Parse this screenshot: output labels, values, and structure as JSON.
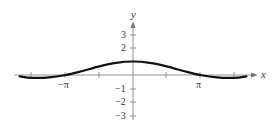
{
  "chart_data": {
    "type": "line",
    "title": "",
    "xlabel": "x",
    "ylabel": "y",
    "x_tick_labels": [
      "−π",
      "π"
    ],
    "x_ticks": [
      -4.712,
      -3.1416,
      -1.5708,
      0,
      1.5708,
      3.1416,
      4.712
    ],
    "y_tick_labels": [
      "3",
      "2",
      "−1",
      "−2",
      "−3"
    ],
    "y_ticks": [
      3,
      2,
      -1,
      -2,
      -3
    ],
    "xlim": [
      -5.5,
      5.5
    ],
    "ylim": [
      -3.5,
      4
    ],
    "grid": false,
    "legend": null,
    "series": [
      {
        "name": "curve",
        "description": "Smooth curve with maximum 1 at x=0, crossing zero at x=±π, slight negative minimum near ±1.5π",
        "x": [
          -5.3,
          -4.712,
          -3.927,
          -3.1416,
          -2.356,
          -1.5708,
          -0.785,
          0,
          0.785,
          1.5708,
          2.356,
          3.1416,
          3.927,
          4.712,
          5.3
        ],
        "y": [
          -0.1,
          -0.21,
          -0.18,
          0,
          0.3,
          0.64,
          0.9,
          1,
          0.9,
          0.64,
          0.3,
          0,
          -0.18,
          -0.21,
          -0.1
        ]
      }
    ]
  },
  "labels": {
    "x_axis": "x",
    "y_axis": "y",
    "neg_pi": "−π",
    "pi": "π",
    "y3": "3",
    "y2": "2",
    "yn1": "−1",
    "yn2": "−2",
    "yn3": "−3"
  }
}
